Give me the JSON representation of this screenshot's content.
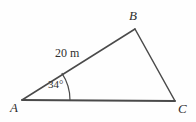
{
  "figure": {
    "kind": "triangle-diagram",
    "background_color": "#fefefe",
    "stroke_color": "#4a4a4a",
    "text_color": "#2e2e2e",
    "vertices": {
      "A": {
        "label": "A",
        "x": 22,
        "y": 100
      },
      "B": {
        "label": "B",
        "x": 135,
        "y": 29
      },
      "C": {
        "label": "C",
        "x": 175,
        "y": 101
      }
    },
    "sides": {
      "ab": {
        "length_label": "20 m"
      },
      "bc": {
        "length_label": ""
      },
      "ac": {
        "length_label": ""
      }
    },
    "angles": {
      "at_a": {
        "label": "34°",
        "value": 34,
        "unit": "degrees",
        "arc_radius": 48
      }
    }
  }
}
